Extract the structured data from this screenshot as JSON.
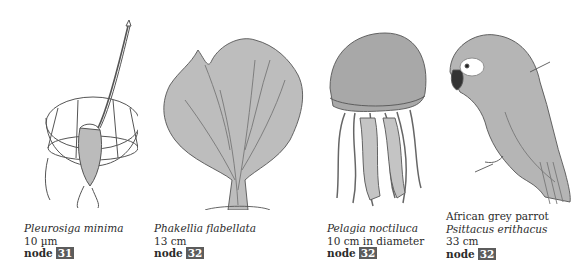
{
  "specimens": [
    {
      "common_name": "",
      "scientific_name": "Pleurosiga minima",
      "size": "10 µm",
      "node_label": "node",
      "node_number": "31",
      "illustration": "choanoflagellate-illustration"
    },
    {
      "common_name": "",
      "scientific_name": "Phakellia flabellata",
      "size": "13 cm",
      "node_label": "node",
      "node_number": "32",
      "illustration": "sponge-illustration"
    },
    {
      "common_name": "",
      "scientific_name": "Pelagia noctiluca",
      "size": "10 cm in diameter",
      "node_label": "node",
      "node_number": "32",
      "illustration": "jellyfish-illustration"
    },
    {
      "common_name": "African grey parrot",
      "scientific_name": "Psittacus erithacus",
      "size": "33 cm",
      "node_label": "node",
      "node_number": "32",
      "illustration": "parrot-illustration"
    }
  ],
  "colors": {
    "badge_bg": "#5c5c5c",
    "badge_text": "#ffffff",
    "ink": "#2b2b2b"
  }
}
